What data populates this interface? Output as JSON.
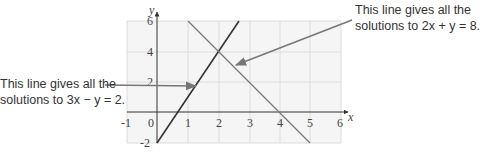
{
  "diagram": {
    "x_axis": {
      "label": "x",
      "ticks": [
        "-1",
        "0",
        "1",
        "2",
        "3",
        "4",
        "5",
        "6"
      ]
    },
    "y_axis": {
      "label": "y",
      "ticks": [
        "-2",
        "2",
        "4",
        "6"
      ]
    },
    "lines": [
      {
        "equation": "3x - y = 2",
        "from": [
          0,
          -2
        ],
        "to": [
          2.67,
          6
        ],
        "color": "#333333"
      },
      {
        "equation": "2x + y = 8",
        "from": [
          1,
          6
        ],
        "to": [
          5,
          -2
        ],
        "color": "#777777"
      }
    ],
    "intersection": [
      2,
      4
    ]
  },
  "annotations": {
    "left": {
      "line1": "This line gives all the",
      "line2": "solutions to 3x − y = 2."
    },
    "right": {
      "line1": "This line gives all the",
      "line2": "solutions to 2x + y = 8."
    }
  },
  "colors": {
    "arrow": "#777777",
    "grid": "#dcdcdc",
    "background": "#f5f5f5"
  }
}
